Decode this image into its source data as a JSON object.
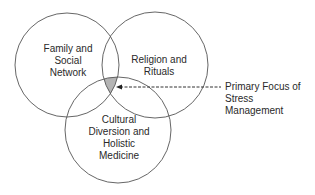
{
  "diagram": {
    "type": "venn",
    "circles": [
      {
        "id": "family",
        "lines": [
          "Family and",
          "Social",
          "Network"
        ],
        "cx": 67,
        "cy": 65,
        "r": 52
      },
      {
        "id": "religion",
        "lines": [
          "Religion and",
          "Rituals"
        ],
        "cx": 155,
        "cy": 65,
        "r": 53
      },
      {
        "id": "cultural",
        "lines": [
          "Cultural",
          "Diversion and",
          "Holistic",
          "Medicine"
        ],
        "cx": 118,
        "cy": 130,
        "r": 53
      }
    ],
    "intersection_fill": "#b4b4b4",
    "stroke_color": "#555555",
    "callout": {
      "lines": [
        "Primary Focus of",
        "Stress",
        "Management"
      ],
      "arrow_style": "dashed"
    }
  }
}
